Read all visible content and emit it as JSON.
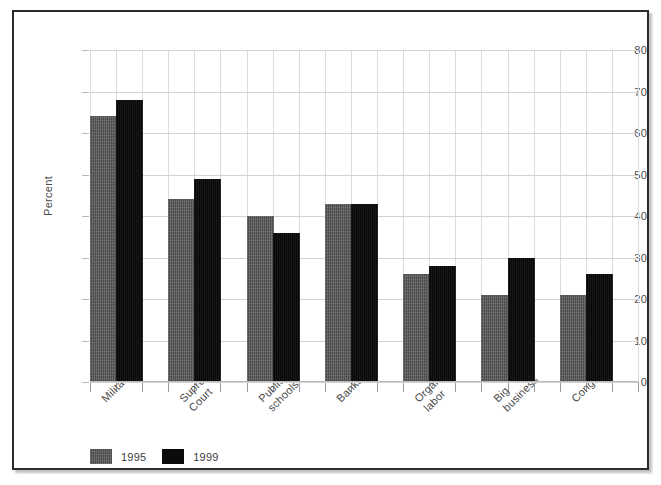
{
  "chart_data": {
    "type": "bar",
    "title": "",
    "subtitle": "",
    "xlabel": "",
    "ylabel": "Percent",
    "ylim": [
      0,
      80
    ],
    "ytick_labels": [
      "0",
      "10",
      "20",
      "30",
      "40",
      "50",
      "60",
      "70",
      "80"
    ],
    "ytick_values": [
      0,
      10,
      20,
      30,
      40,
      50,
      60,
      70,
      80
    ],
    "grid": true,
    "legend_position": "bottom-left",
    "categories": [
      "Military",
      "Supreme Court",
      "Public schools",
      "Banks",
      "Organized labor",
      "Big business",
      "Congress"
    ],
    "category_label_lines": [
      [
        "Military"
      ],
      [
        "Supreme",
        "Court"
      ],
      [
        "Public",
        "schools"
      ],
      [
        "Banks"
      ],
      [
        "Organized",
        "labor"
      ],
      [
        "Big",
        "business"
      ],
      [
        "Congress"
      ]
    ],
    "series": [
      {
        "name": "1995",
        "color": "#595959",
        "values": [
          64,
          44,
          40,
          43,
          26,
          21,
          21
        ]
      },
      {
        "name": "1999",
        "color": "#0b0b0b",
        "values": [
          68,
          49,
          36,
          43,
          28,
          30,
          26
        ]
      }
    ]
  },
  "legend": {
    "entries": [
      {
        "label": "1995",
        "swatch": "series-1995-swatch"
      },
      {
        "label": "1999",
        "swatch": "series-1999-swatch"
      }
    ]
  },
  "axes": {
    "y_axis_title": "Percent"
  }
}
